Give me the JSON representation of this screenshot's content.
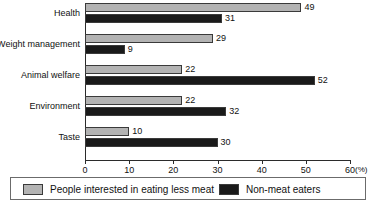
{
  "chart_data": {
    "type": "bar",
    "orientation": "horizontal",
    "title": "",
    "xlabel": "(%)",
    "ylabel": "",
    "categories": [
      "Health",
      "Weight management",
      "Animal welfare",
      "Environment",
      "Taste"
    ],
    "series": [
      {
        "name": "People interested in eating less meat",
        "color": "#b3b3b3",
        "values": [
          49,
          29,
          22,
          22,
          10
        ]
      },
      {
        "name": "Non-meat eaters",
        "color": "#1a1a1a",
        "values": [
          31,
          9,
          52,
          32,
          30
        ]
      }
    ],
    "xlim": [
      0,
      60
    ],
    "xticks": [
      0,
      10,
      20,
      30,
      40,
      50,
      60
    ],
    "xtick_labels": [
      "0",
      "10",
      "20",
      "30",
      "40",
      "50",
      "60"
    ],
    "unit_label": "(%)",
    "grid": false,
    "legend_position": "bottom",
    "data_labels": true
  },
  "legend": {
    "items": [
      {
        "label": "People interested in eating less meat",
        "color": "#b3b3b3"
      },
      {
        "label": "Non-meat eaters",
        "color": "#1a1a1a"
      }
    ]
  }
}
